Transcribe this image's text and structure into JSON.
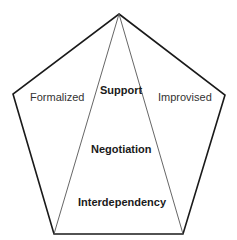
{
  "diagram": {
    "shape": "pentagon",
    "outer_labels": {
      "left": "Formalized",
      "right": "Improvised"
    },
    "center_labels": [
      "Support",
      "Negotiation",
      "Interdependency"
    ],
    "colors": {
      "outline": "#1a1a1a",
      "inner_lines": "#555555",
      "text": "#1a1a1a",
      "background": "#ffffff"
    }
  }
}
